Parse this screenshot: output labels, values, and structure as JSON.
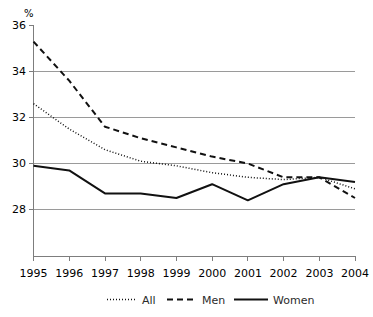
{
  "chart_data": {
    "type": "line",
    "title": "",
    "subtitle": "",
    "xlabel": "",
    "ylabel": "%",
    "unit_label": "%",
    "categories": [
      "1995",
      "1996",
      "1997",
      "1998",
      "1999",
      "2000",
      "2001",
      "2002",
      "2003",
      "2004"
    ],
    "x": [
      1995,
      1996,
      1997,
      1998,
      1999,
      2000,
      2001,
      2002,
      2003,
      2004
    ],
    "ylim": [
      26.6,
      36.0
    ],
    "xlim": [
      1995,
      2004
    ],
    "yticks": [
      28,
      30,
      32,
      34,
      36
    ],
    "ytick_labels": [
      "28",
      "30",
      "32",
      "34",
      "36"
    ],
    "grid": true,
    "grid_axis": "y",
    "legend_position": "bottom",
    "series": [
      {
        "name": "All",
        "style": "dotted",
        "color": "#111111",
        "values": [
          32.6,
          31.5,
          30.6,
          30.1,
          29.9,
          29.6,
          29.4,
          29.3,
          29.4,
          28.9
        ]
      },
      {
        "name": "Men",
        "style": "dashed",
        "color": "#111111",
        "values": [
          35.3,
          33.6,
          31.6,
          31.1,
          30.7,
          30.3,
          30.0,
          29.4,
          29.4,
          28.5
        ]
      },
      {
        "name": "Women",
        "style": "solid",
        "color": "#111111",
        "values": [
          29.9,
          29.7,
          28.7,
          28.7,
          28.5,
          29.1,
          28.4,
          29.1,
          29.4,
          29.2
        ]
      }
    ]
  },
  "legend": {
    "items": [
      {
        "label": "All",
        "style": "dotted"
      },
      {
        "label": "Men",
        "style": "dashed"
      },
      {
        "label": "Women",
        "style": "solid"
      }
    ]
  },
  "axes": {
    "y_unit": "%",
    "y_tick_labels": [
      "36",
      "34",
      "32",
      "30",
      "28"
    ],
    "x_tick_labels": [
      "1995",
      "1996",
      "1997",
      "1998",
      "1999",
      "2000",
      "2001",
      "2002",
      "2003",
      "2004"
    ]
  }
}
